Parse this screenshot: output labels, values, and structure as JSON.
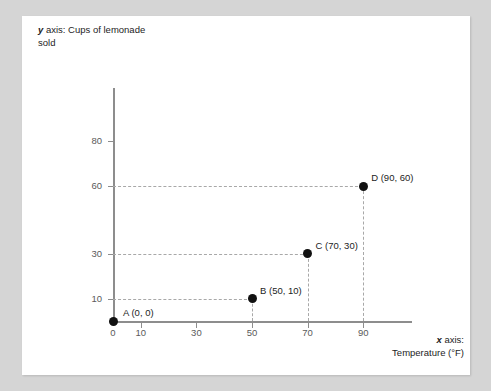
{
  "card": {
    "background_color": "#ffffff",
    "page_background_color": "#d5d5d5"
  },
  "axis_titles": {
    "y_prefix": "y",
    "y_text": " axis: Cups of lemonade sold",
    "x_prefix": "x",
    "x_text": " axis:",
    "x_text_line2": "Temperature (°F)"
  },
  "chart_data": {
    "type": "scatter",
    "title": "",
    "xlabel": "x axis: Temperature (°F)",
    "ylabel": "y axis: Cups of lemonade sold",
    "xlim": [
      0,
      97
    ],
    "ylim": [
      0,
      87
    ],
    "grid": false,
    "legend": "none",
    "xticks": [
      0,
      10,
      30,
      50,
      70,
      90
    ],
    "xtick_labels": [
      "0",
      "10",
      "30",
      "50",
      "70",
      "90"
    ],
    "yticks": [
      10,
      30,
      60,
      80
    ],
    "ytick_labels": [
      "10",
      "30",
      "60",
      "80"
    ],
    "axis_color": "#8d8d8d",
    "point_color": "#111111",
    "guide_color": "#a8a8a8",
    "points": [
      {
        "id": "A",
        "x": 0,
        "y": 0,
        "label": "A (0, 0)",
        "label_dx": 10,
        "label_dy": -14,
        "guides": false
      },
      {
        "id": "B",
        "x": 50,
        "y": 10,
        "label": "B (50, 10)",
        "label_dx": 8,
        "label_dy": -14,
        "guides": true
      },
      {
        "id": "C",
        "x": 70,
        "y": 30,
        "label": "C (70, 30)",
        "label_dx": 8,
        "label_dy": -14,
        "guides": true
      },
      {
        "id": "D",
        "x": 90,
        "y": 60,
        "label": "D (90, 60)",
        "label_dx": 8,
        "label_dy": -14,
        "guides": true
      }
    ]
  }
}
